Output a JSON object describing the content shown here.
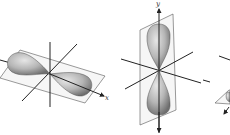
{
  "diagram": {
    "panels": [
      {
        "id": "px",
        "axis_label": "x",
        "orientation": "horizontal"
      },
      {
        "id": "py",
        "axis_label": "y",
        "orientation": "vertical"
      },
      {
        "id": "pz",
        "axis_label": "",
        "orientation": "partial"
      }
    ]
  },
  "colors": {
    "lobe_light": "#d4d4d4",
    "lobe_dark": "#7a7a7a",
    "axis": "#222222",
    "plane": "#555555"
  }
}
